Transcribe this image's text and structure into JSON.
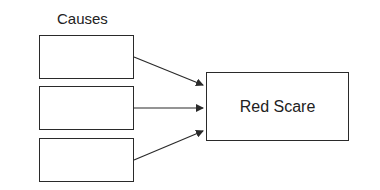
{
  "diagram": {
    "causes_label": "Causes",
    "causes": [
      "",
      "",
      ""
    ],
    "effect_label": "Red Scare",
    "arrows": [
      {
        "from": "cause-1",
        "to": "effect"
      },
      {
        "from": "cause-2",
        "to": "effect"
      },
      {
        "from": "cause-3",
        "to": "effect"
      }
    ]
  }
}
